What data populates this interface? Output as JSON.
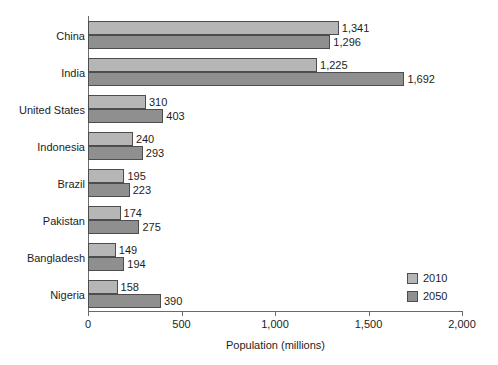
{
  "chart_data": {
    "type": "bar",
    "orientation": "horizontal",
    "title": "",
    "xlabel": "Population (millions)",
    "ylabel": "",
    "xlim": [
      0,
      2000
    ],
    "xticks": [
      0,
      500,
      1000,
      1500,
      2000
    ],
    "xtick_labels": [
      "0",
      "500",
      "1,000",
      "1,500",
      "2,000"
    ],
    "grid": false,
    "legend_position": "bottom-right",
    "categories": [
      "China",
      "India",
      "United States",
      "Indonesia",
      "Brazil",
      "Pakistan",
      "Bangladesh",
      "Nigeria"
    ],
    "series": [
      {
        "name": "2010",
        "color": "#b6b6b6",
        "values": [
          1341,
          1225,
          310,
          240,
          195,
          174,
          149,
          158
        ],
        "value_labels": [
          "1,341",
          "1,225",
          "310",
          "240",
          "195",
          "174",
          "149",
          "158"
        ]
      },
      {
        "name": "2050",
        "color": "#8f8f8f",
        "values": [
          1296,
          1692,
          403,
          293,
          223,
          275,
          194,
          390
        ],
        "value_labels": [
          "1,296",
          "1,692",
          "403",
          "293",
          "223",
          "275",
          "194",
          "390"
        ]
      }
    ]
  },
  "legend": {
    "items": [
      {
        "label": "2010",
        "color": "#b6b6b6"
      },
      {
        "label": "2050",
        "color": "#8f8f8f"
      }
    ]
  },
  "axis": {
    "x_title": "Population (millions)"
  },
  "colors": {
    "series_2010": "#b6b6b6",
    "series_2050": "#8f8f8f",
    "axis_line": "#6a6a6a",
    "bar_outline": "#4d4d4d",
    "text": "#1d1d1d",
    "background": "#ffffff"
  }
}
